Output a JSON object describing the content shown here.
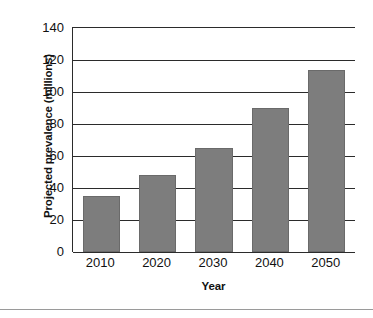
{
  "chart_data": {
    "type": "bar",
    "title": "",
    "xlabel": "Year",
    "ylabel": "Projected prevalence (millions)",
    "categories": [
      "2010",
      "2020",
      "2030",
      "2040",
      "2050"
    ],
    "values": [
      35,
      48,
      65,
      90,
      114
    ],
    "ylim": [
      0,
      140
    ],
    "yticks": [
      0,
      20,
      40,
      60,
      80,
      100,
      120,
      140
    ],
    "ytick_labels": [
      "0",
      "20",
      "40",
      "60",
      "80",
      "100",
      "120",
      "140"
    ],
    "grid": true,
    "legend": "none",
    "series": [
      {
        "name": "Projected prevalence",
        "values": [
          35,
          48,
          65,
          90,
          114
        ],
        "color": "#7d7d7d"
      }
    ]
  },
  "style": {
    "bar_color": "#7d7d7d",
    "axis_color": "#2b2b2b",
    "background": "#ffffff",
    "rule_color": "#9a9a9a"
  }
}
